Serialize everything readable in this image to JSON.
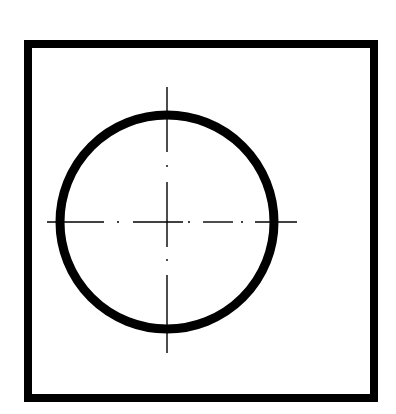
{
  "diagram": {
    "type": "technical-drawing",
    "colors": {
      "stroke": "#000000",
      "background": "#ffffff"
    },
    "square": {
      "x": 28,
      "y": 44,
      "width": 346,
      "height": 354,
      "stroke_width": 8
    },
    "circle": {
      "cx": 167,
      "cy": 222,
      "r": 107,
      "stroke_width": 9
    },
    "centerlines": {
      "horizontal": {
        "y": 222,
        "dashes": [
          [
            47,
            104
          ],
          [
            133,
            183
          ],
          [
            203,
            233
          ],
          [
            255,
            297
          ]
        ],
        "dots": [
          118,
          189,
          242
        ]
      },
      "vertical": {
        "x": 167,
        "dashes": [
          [
            87,
            152
          ],
          [
            182,
            247
          ],
          [
            275,
            353
          ]
        ],
        "dots": [
          166,
          260
        ]
      }
    }
  }
}
